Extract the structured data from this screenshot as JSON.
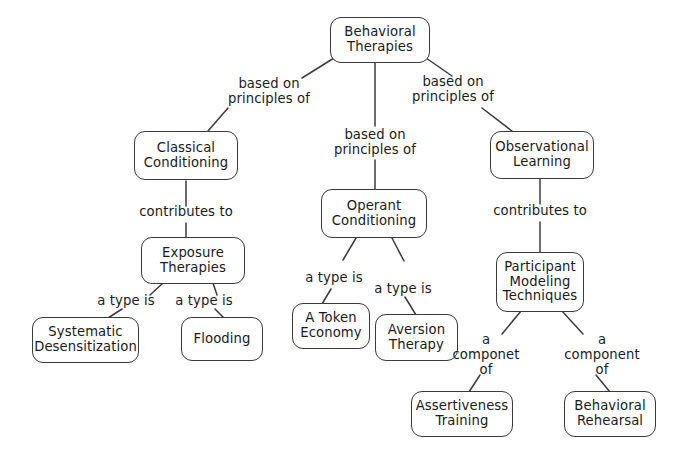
{
  "diagram": {
    "type": "concept-map",
    "style": {
      "node_fill": "#ffffff",
      "node_border": "#3b3b3b",
      "text_color": "#1a1a1a",
      "edge_color": "#3b3b3b",
      "background": "#ffffff"
    },
    "nodes": [
      {
        "id": "behavioral-therapies",
        "label": "Behavioral\nTherapies"
      },
      {
        "id": "classical-conditioning",
        "label": "Classical\nConditioning"
      },
      {
        "id": "operant-conditioning",
        "label": "Operant\nConditioning"
      },
      {
        "id": "observational-learning",
        "label": "Observational\nLearning"
      },
      {
        "id": "exposure-therapies",
        "label": "Exposure\nTherapies"
      },
      {
        "id": "participant-modeling-techniques",
        "label": "Participant\nModeling\nTechniques"
      },
      {
        "id": "systematic-desensitization",
        "label": "Systematic\nDesensitization"
      },
      {
        "id": "flooding",
        "label": "Flooding"
      },
      {
        "id": "a-token-economy",
        "label": "A Token\nEconomy"
      },
      {
        "id": "aversion-therapy",
        "label": "Aversion\nTherapy"
      },
      {
        "id": "assertiveness-training",
        "label": "Assertiveness\nTraining"
      },
      {
        "id": "behavioral-rehearsal",
        "label": "Behavioral\nRehearsal"
      }
    ],
    "edge_labels": [
      {
        "id": "based-on-principles-of-left",
        "label": "based on\nprinciples of"
      },
      {
        "id": "based-on-principles-of-middle",
        "label": "based on\nprinciples of"
      },
      {
        "id": "based-on-principles-of-right",
        "label": "based on\nprinciples of"
      },
      {
        "id": "contributes-to-left",
        "label": "contributes to"
      },
      {
        "id": "contributes-to-right",
        "label": "contributes to"
      },
      {
        "id": "a-type-is-systematic",
        "label": "a type is"
      },
      {
        "id": "a-type-is-flooding",
        "label": "a type is"
      },
      {
        "id": "a-type-is-token-economy",
        "label": "a type is"
      },
      {
        "id": "a-type-is-aversion-therapy",
        "label": "a type is"
      },
      {
        "id": "a-componet-of-assertiveness",
        "label": "a\ncomponet\nof"
      },
      {
        "id": "a-component-of-rehearsal",
        "label": "a\ncomponent\nof"
      }
    ],
    "relations": [
      {
        "from": "behavioral-therapies",
        "to": "classical-conditioning",
        "label": "based on principles of"
      },
      {
        "from": "behavioral-therapies",
        "to": "operant-conditioning",
        "label": "based on principles of"
      },
      {
        "from": "behavioral-therapies",
        "to": "observational-learning",
        "label": "based on principles of"
      },
      {
        "from": "classical-conditioning",
        "to": "exposure-therapies",
        "label": "contributes to"
      },
      {
        "from": "exposure-therapies",
        "to": "systematic-desensitization",
        "label": "a type is"
      },
      {
        "from": "exposure-therapies",
        "to": "flooding",
        "label": "a type is"
      },
      {
        "from": "operant-conditioning",
        "to": "a-token-economy",
        "label": "a type is"
      },
      {
        "from": "operant-conditioning",
        "to": "aversion-therapy",
        "label": "a type is"
      },
      {
        "from": "observational-learning",
        "to": "participant-modeling-techniques",
        "label": "contributes to"
      },
      {
        "from": "participant-modeling-techniques",
        "to": "assertiveness-training",
        "label": "a componet of"
      },
      {
        "from": "participant-modeling-techniques",
        "to": "behavioral-rehearsal",
        "label": "a component of"
      }
    ]
  }
}
